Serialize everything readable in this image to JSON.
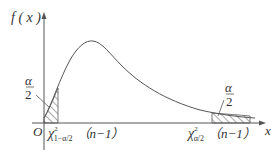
{
  "diagram": {
    "y_axis_label": "f ( x )",
    "x_axis_label": "x",
    "origin_label": "O",
    "left_tail": {
      "alpha_num": "α",
      "alpha_den": "2",
      "quantile_symbol": "χ",
      "quantile_sup": "2",
      "quantile_sub": "1−α/2",
      "quantile_arg": "（n−1）"
    },
    "right_tail": {
      "alpha_num": "α",
      "alpha_den": "2",
      "quantile_symbol": "χ",
      "quantile_sup": "2",
      "quantile_sub": "α/2",
      "quantile_arg": "（n−1）"
    },
    "colors": {
      "line": "#555555",
      "text": "#333333",
      "background": "#ffffff"
    }
  }
}
